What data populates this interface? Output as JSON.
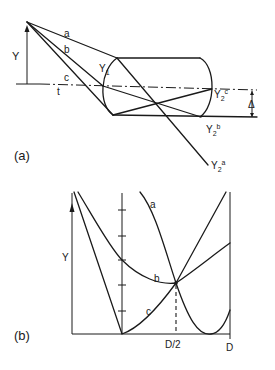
{
  "figure": {
    "panel_a": {
      "label": "(a)",
      "height_label": "Y",
      "ray_labels": {
        "a": "a",
        "b": "b",
        "c": "c"
      },
      "axis_label": "t",
      "entry_label": {
        "main": "Y",
        "sub": "1"
      },
      "exit_labels": {
        "c": {
          "main": "Y",
          "sub": "2",
          "sup": "c"
        },
        "b": {
          "main": "Y",
          "sub": "2",
          "sup": "b"
        },
        "a": {
          "main": "Y",
          "sub": "2",
          "sup": "a"
        }
      },
      "offset_label": "Δ"
    },
    "panel_b": {
      "label": "(b)",
      "y_axis_label": "Y",
      "x_tick_labels": [
        "D/2",
        "D"
      ],
      "curve_labels": {
        "a": "a",
        "b": "b",
        "c": "c"
      },
      "mid_axis_tick_count": 5
    },
    "colors": {
      "line": "#1a1a1a",
      "background": "#ffffff"
    }
  }
}
